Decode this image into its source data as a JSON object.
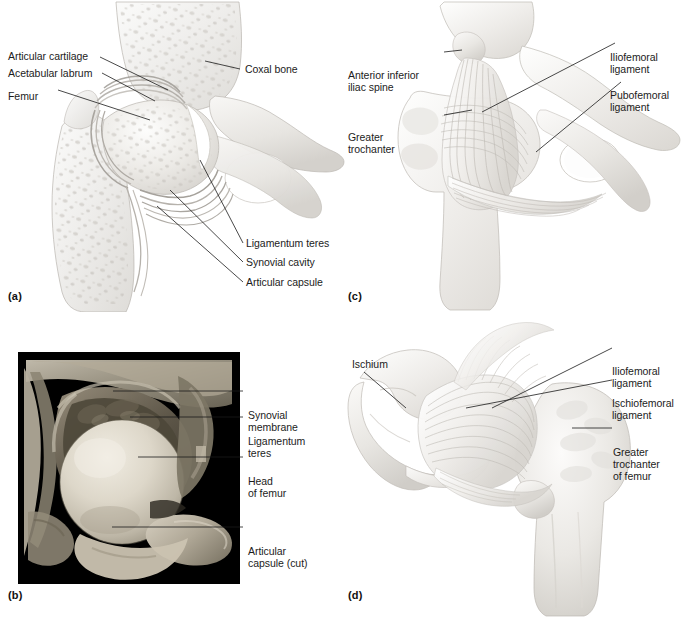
{
  "figure": {
    "panel_count": 4,
    "background_color": "#ffffff",
    "label_text_color": "#1c1c1c",
    "leader_line_color": "#1a1a1a"
  },
  "panels": [
    {
      "letter": "(a)",
      "key": "a",
      "kind": "illustration",
      "description": "Frontal section through the right hip joint showing bone interior",
      "labels": [
        {
          "name": "articular-cartilage",
          "text": "Articular cartilage"
        },
        {
          "name": "acetabular-labrum",
          "text": "Acetabular labrum"
        },
        {
          "name": "femur",
          "text": "Femur"
        },
        {
          "name": "coxal-bone",
          "text": "Coxal bone"
        },
        {
          "name": "ligamentum-teres",
          "text": "Ligamentum teres"
        },
        {
          "name": "synovial-cavity",
          "text": "Synovial cavity"
        },
        {
          "name": "articular-capsule",
          "text": "Articular capsule"
        }
      ]
    },
    {
      "letter": "(b)",
      "key": "b",
      "kind": "photograph",
      "description": "Photograph of a dissected hip joint, frontal section, black background",
      "labels": [
        {
          "name": "synovial-membrane",
          "text": "Synovial\nmembrane"
        },
        {
          "name": "ligamentum-teres",
          "text": "Ligamentum\nteres"
        },
        {
          "name": "head-of-femur",
          "text": "Head\nof femur"
        },
        {
          "name": "articular-capsule-cut",
          "text": "Articular\ncapsule (cut)"
        }
      ]
    },
    {
      "letter": "(c)",
      "key": "c",
      "kind": "illustration",
      "description": "Anterior view of the right hip joint ligaments",
      "labels": [
        {
          "name": "anterior-inferior-iliac-spine",
          "text": "Anterior inferior\niliac spine"
        },
        {
          "name": "greater-trochanter",
          "text": "Greater\ntrochanter"
        },
        {
          "name": "iliofemoral-ligament",
          "text": "Iliofemoral\nligament"
        },
        {
          "name": "pubofemoral-ligament",
          "text": "Pubofemoral\nligament"
        }
      ]
    },
    {
      "letter": "(d)",
      "key": "d",
      "kind": "illustration",
      "description": "Posterior view of the right hip joint ligaments",
      "labels": [
        {
          "name": "ischium",
          "text": "Ischium"
        },
        {
          "name": "iliofemoral-ligament",
          "text": "Iliofemoral\nligament"
        },
        {
          "name": "ischiofemoral-ligament",
          "text": "Ischiofemoral\nligament"
        },
        {
          "name": "greater-trochanter-of-femur",
          "text": "Greater\ntrochanter\nof femur"
        }
      ]
    }
  ]
}
